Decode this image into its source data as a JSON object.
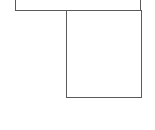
{
  "canvas": {
    "width": 155,
    "height": 130,
    "background": "#ffffff"
  },
  "stroke_color": "#5a5a5a",
  "shapes": [
    {
      "id": "top-box",
      "type": "rect",
      "x": 15,
      "y": -4,
      "width": 126,
      "height": 15,
      "note": "top edge off-screen"
    },
    {
      "id": "bottom-box",
      "type": "rect",
      "x": 66,
      "y": 10,
      "width": 76,
      "height": 88
    }
  ],
  "labels": []
}
